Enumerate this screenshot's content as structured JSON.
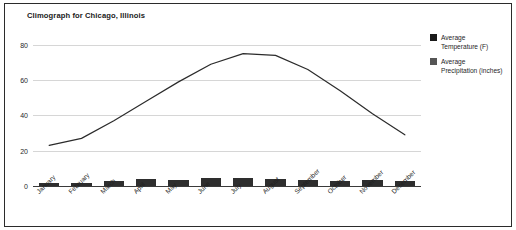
{
  "chart_data": {
    "type": "line",
    "title": "Climograph for Chicago, Illinois",
    "xlabel": "",
    "ylabel": "",
    "ylim": [
      0,
      85
    ],
    "yticks": [
      0,
      20,
      40,
      60,
      80
    ],
    "grid": true,
    "legend_position": "right",
    "categories": [
      "January",
      "February",
      "March",
      "April",
      "May",
      "June",
      "July",
      "August",
      "September",
      "October",
      "November",
      "December"
    ],
    "series": [
      {
        "name": "Average Temperature (F)",
        "render": "line",
        "color": "#2b2b2b",
        "values": [
          23,
          27,
          37,
          48,
          59,
          69,
          75,
          74,
          66,
          54,
          41,
          29
        ]
      },
      {
        "name": "Average Precipitation (inches)",
        "render": "bar",
        "color": "#2e2e2e",
        "values": [
          1.7,
          1.6,
          2.7,
          3.8,
          3.4,
          4.4,
          4.3,
          4.0,
          3.3,
          2.7,
          3.2,
          2.7
        ]
      }
    ]
  },
  "chart": {
    "title": "Climograph for Chicago, Illinois",
    "y_axis": {
      "ticks": [
        "0",
        "20",
        "40",
        "60",
        "80"
      ]
    },
    "x_axis": {
      "labels": [
        "January",
        "February",
        "March",
        "April",
        "May",
        "June",
        "July",
        "August",
        "September",
        "October",
        "November",
        "December"
      ]
    },
    "legend": {
      "items": [
        {
          "label": "Average Temperature (F)",
          "color": "#1a1a1a"
        },
        {
          "label": "Average Precipitation (inches)",
          "color": "#555555"
        }
      ]
    },
    "colors": {
      "line": "#2b2b2b",
      "bar": "#2e2e2e",
      "grid": "#d6d6d6",
      "border": "#2b2b2b",
      "background": "#ffffff"
    }
  }
}
